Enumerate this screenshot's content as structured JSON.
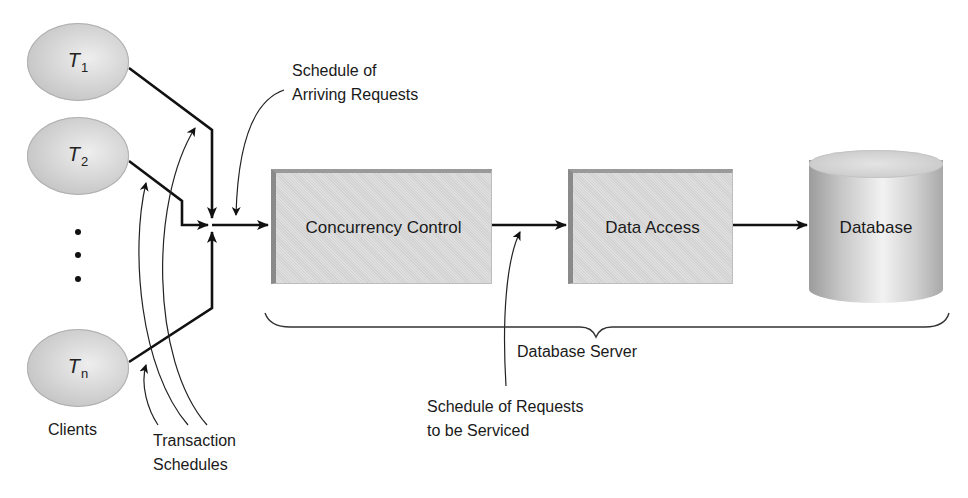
{
  "diagram": {
    "clients": [
      {
        "id": "T1",
        "letter": "T",
        "subscript": "1"
      },
      {
        "id": "T2",
        "letter": "T",
        "subscript": "2"
      },
      {
        "id": "Tn",
        "letter": "T",
        "subscript": "n"
      }
    ],
    "ellipsis": "...",
    "clients_label": "Clients",
    "transaction_schedules_label": [
      "Transaction",
      "Schedules"
    ],
    "arriving_requests_label": [
      "Schedule of",
      "Arriving Requests"
    ],
    "concurrency_control_label": "Concurrency Control",
    "data_access_label": "Data Access",
    "database_label": "Database",
    "database_server_label": "Database Server",
    "requests_serviced_label": [
      "Schedule of Requests",
      "to be Serviced"
    ],
    "colors": {
      "client_fill": "#d0d0d0",
      "box_fill": "#d9d9d9",
      "box_edge": "#8a8a8a",
      "line": "#111111"
    }
  }
}
